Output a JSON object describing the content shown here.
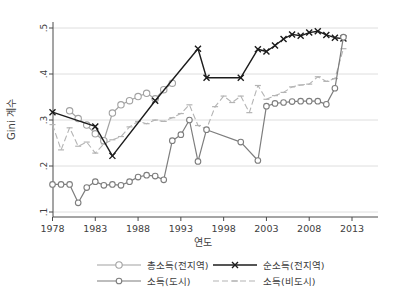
{
  "figure": {
    "ylabel": "Gini 계수",
    "xlabel": "연도",
    "background": "#ffffff",
    "grid_color": "#dedede",
    "axis_color": "#4a4a4a",
    "text_color": "#404040"
  },
  "chart_data": {
    "type": "line",
    "title": "",
    "xlabel": "연도",
    "ylabel": "Gini 계수",
    "xlim": [
      1977,
      2016
    ],
    "ylim": [
      0.1,
      0.5
    ],
    "x_ticks": [
      1978,
      1983,
      1988,
      1993,
      1998,
      2003,
      2008,
      2013
    ],
    "y_ticks": [
      0.1,
      0.2,
      0.3,
      0.4,
      0.5
    ],
    "y_tick_labels": [
      ".1",
      ".2",
      ".3",
      ".4",
      ".5"
    ],
    "grid": true,
    "legend_position": "bottom",
    "legend_order": [
      0,
      1,
      2,
      3
    ],
    "series": [
      {
        "name": "총소득(전지역)",
        "color": "#a2a2a2",
        "marker": "circle",
        "marker_r": 3.2,
        "line": "solid",
        "width": 1.2,
        "points": [
          [
            1980,
            0.32
          ],
          [
            1981,
            0.303
          ],
          [
            1982,
            0.289
          ],
          [
            1983,
            0.27
          ],
          [
            1984,
            0.255
          ],
          [
            1985,
            0.315
          ],
          [
            1986,
            0.333
          ],
          [
            1987,
            0.342
          ],
          [
            1988,
            0.351
          ],
          [
            1989,
            0.358
          ],
          [
            1990,
            0.346
          ],
          [
            1991,
            0.366
          ],
          [
            1992,
            0.38
          ]
        ]
      },
      {
        "name": "순소득(전지역)",
        "color": "#1c1c1c",
        "marker": "x",
        "marker_r": 3,
        "line": "solid",
        "width": 1.4,
        "points": [
          [
            1978,
            0.317
          ],
          [
            1983,
            0.286
          ],
          [
            1985,
            0.222
          ],
          [
            1990,
            0.342
          ],
          [
            1995,
            0.455
          ],
          [
            1996,
            0.392
          ],
          [
            2000,
            0.392
          ],
          [
            2002,
            0.454
          ],
          [
            2003,
            0.449
          ],
          [
            2004,
            0.462
          ],
          [
            2005,
            0.476
          ],
          [
            2006,
            0.486
          ],
          [
            2007,
            0.483
          ],
          [
            2008,
            0.49
          ],
          [
            2009,
            0.493
          ],
          [
            2010,
            0.485
          ],
          [
            2011,
            0.479
          ],
          [
            2012,
            0.477
          ]
        ]
      },
      {
        "name": "소득(도시)",
        "color": "#7d7d7d",
        "marker": "circle",
        "marker_r": 2.8,
        "line": "solid",
        "width": 1.2,
        "points": [
          [
            1978,
            0.16
          ],
          [
            1979,
            0.16
          ],
          [
            1980,
            0.16
          ],
          [
            1981,
            0.12
          ],
          [
            1982,
            0.153
          ],
          [
            1983,
            0.166
          ],
          [
            1984,
            0.158
          ],
          [
            1985,
            0.16
          ],
          [
            1986,
            0.158
          ],
          [
            1987,
            0.166
          ],
          [
            1988,
            0.176
          ],
          [
            1989,
            0.18
          ],
          [
            1990,
            0.178
          ],
          [
            1991,
            0.17
          ],
          [
            1992,
            0.255
          ],
          [
            1993,
            0.268
          ],
          [
            1994,
            0.3
          ],
          [
            1995,
            0.21
          ],
          [
            1996,
            0.279
          ],
          [
            2000,
            0.252
          ],
          [
            2002,
            0.212
          ],
          [
            2003,
            0.33
          ],
          [
            2004,
            0.336
          ],
          [
            2005,
            0.338
          ],
          [
            2006,
            0.34
          ],
          [
            2007,
            0.341
          ],
          [
            2008,
            0.341
          ],
          [
            2009,
            0.341
          ],
          [
            2010,
            0.334
          ],
          [
            2011,
            0.369
          ],
          [
            2012,
            0.48
          ]
        ]
      },
      {
        "name": "소득(비도시)",
        "color": "#b4b4b4",
        "marker": "dash",
        "marker_r": 3,
        "line": "dashed",
        "width": 1.1,
        "points": [
          [
            1978,
            0.29
          ],
          [
            1979,
            0.235
          ],
          [
            1980,
            0.283
          ],
          [
            1981,
            0.243
          ],
          [
            1982,
            0.252
          ],
          [
            1983,
            0.228
          ],
          [
            1984,
            0.248
          ],
          [
            1985,
            0.257
          ],
          [
            1986,
            0.264
          ],
          [
            1987,
            0.285
          ],
          [
            1988,
            0.297
          ],
          [
            1989,
            0.292
          ],
          [
            1990,
            0.3
          ],
          [
            1991,
            0.297
          ],
          [
            1992,
            0.305
          ],
          [
            1993,
            0.314
          ],
          [
            1994,
            0.333
          ],
          [
            1995,
            0.288
          ],
          [
            1996,
            0.28
          ],
          [
            1997,
            0.329
          ],
          [
            1998,
            0.352
          ],
          [
            1999,
            0.338
          ],
          [
            2000,
            0.352
          ],
          [
            2001,
            0.316
          ],
          [
            2002,
            0.375
          ],
          [
            2003,
            0.345
          ],
          [
            2004,
            0.353
          ],
          [
            2005,
            0.36
          ],
          [
            2006,
            0.372
          ],
          [
            2007,
            0.376
          ],
          [
            2008,
            0.378
          ],
          [
            2009,
            0.394
          ],
          [
            2010,
            0.384
          ],
          [
            2011,
            0.39
          ],
          [
            2012,
            0.455
          ]
        ]
      }
    ]
  }
}
